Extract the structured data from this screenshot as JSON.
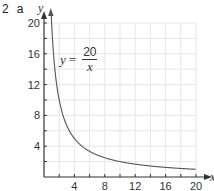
{
  "question": {
    "number": "2",
    "part": "a"
  },
  "equation": {
    "lhs": "y",
    "equals": "=",
    "numerator": "20",
    "denominator": "x"
  },
  "axes": {
    "x_label": "x",
    "y_label": "y",
    "x_ticks": [
      "4",
      "8",
      "12",
      "16",
      "20"
    ],
    "y_ticks": [
      "4",
      "8",
      "12",
      "16",
      "20"
    ]
  },
  "colors": {
    "curve": "#555555",
    "grid": "#e6e6e6",
    "axis": "#333333"
  },
  "chart_data": {
    "type": "line",
    "title": "",
    "xlabel": "x",
    "ylabel": "y",
    "xlim": [
      0,
      20
    ],
    "ylim": [
      0,
      20
    ],
    "grid": true,
    "grid_step": 2,
    "annotations": [
      "y = 20/x"
    ],
    "series": [
      {
        "name": "y = 20/x",
        "x": [
          1,
          1.25,
          1.5,
          2,
          2.5,
          3,
          4,
          5,
          6,
          8,
          10,
          12,
          14,
          16,
          18,
          20
        ],
        "values": [
          20,
          16,
          13.33,
          10,
          8,
          6.67,
          5,
          4,
          3.33,
          2.5,
          2,
          1.67,
          1.43,
          1.25,
          1.11,
          1
        ]
      }
    ]
  }
}
